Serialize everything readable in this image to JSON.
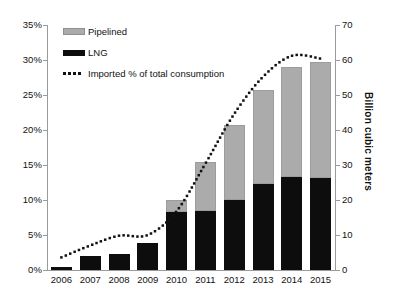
{
  "chart_data": {
    "type": "bar",
    "title": "",
    "subtitle": "",
    "xlabel": "",
    "ylabel": "",
    "ylabel_right": "Billion cubic meters",
    "grid": false,
    "legend_position": "top-left",
    "categories": [
      "2006",
      "2007",
      "2008",
      "2009",
      "2010",
      "2011",
      "2012",
      "2013",
      "2014",
      "2015"
    ],
    "left_axis": {
      "ticks": [
        "0%",
        "5%",
        "10%",
        "15%",
        "20%",
        "25%",
        "30%",
        "35%"
      ],
      "values": [
        0,
        5,
        10,
        15,
        20,
        25,
        30,
        35
      ],
      "ylim": [
        0,
        35
      ],
      "unit": "%"
    },
    "right_axis": {
      "ticks": [
        "0",
        "10",
        "20",
        "30",
        "40",
        "50",
        "60",
        "70"
      ],
      "values": [
        0,
        10,
        20,
        30,
        40,
        50,
        60,
        70
      ],
      "ylim": [
        0,
        70
      ],
      "unit": "Billion cubic meters"
    },
    "series": [
      {
        "name": "LNG",
        "type": "bar-stack",
        "axis": "right",
        "color": "#0d0d0d",
        "values": [
          1.0,
          4.0,
          4.6,
          7.7,
          16.5,
          17.0,
          20.0,
          24.5,
          26.6,
          26.2
        ]
      },
      {
        "name": "Pipelined",
        "type": "bar-stack",
        "axis": "right",
        "color": "#ababab",
        "values": [
          0.0,
          0.0,
          0.0,
          0.0,
          3.5,
          14.0,
          21.4,
          27.0,
          31.4,
          33.2
        ]
      },
      {
        "name": "Imported % of total consumption",
        "type": "line-dotted",
        "axis": "left",
        "color": "#111111",
        "values": [
          1.8,
          3.5,
          4.9,
          5.0,
          8.4,
          15.2,
          22.3,
          27.6,
          30.6,
          30.2
        ]
      }
    ],
    "stack_totals": [
      1.0,
      4.0,
      4.6,
      7.7,
      20.0,
      31.0,
      41.4,
      51.5,
      58.0,
      59.4
    ]
  },
  "legend": {
    "items": [
      {
        "label": "Pipelined",
        "swatch": "filled-gray-rect"
      },
      {
        "label": "LNG",
        "swatch": "filled-black-rect"
      },
      {
        "label": "Imported % of total consumption",
        "swatch": "dotted-line"
      }
    ]
  }
}
